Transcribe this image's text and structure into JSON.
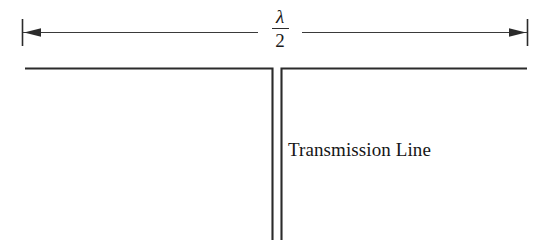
{
  "figure": {
    "background_color": "#ffffff",
    "stroke_color": "#2b2b2b",
    "text_color": "#161616"
  },
  "dimension": {
    "name": "half-wavelength-dimension",
    "numerator": "λ",
    "fraction_bar": "",
    "denominator": "2",
    "full_label": "λ/2",
    "left_arrow": "arrow-left",
    "right_arrow": "arrow-right",
    "left_tick": "extension-tick-left",
    "right_tick": "extension-tick-right"
  },
  "diagram": {
    "title": "",
    "horizontal_line_label": "",
    "stub_label": "Transmission Line",
    "elements": [
      "horizontal-conductor-left",
      "horizontal-conductor-right",
      "vertical-stub-left-conductor",
      "vertical-stub-right-conductor"
    ]
  },
  "labels": {
    "transmission_line": "Transmission Line"
  }
}
